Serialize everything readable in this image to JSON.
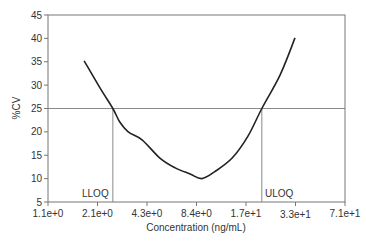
{
  "chart_data": {
    "type": "line",
    "title": "",
    "xlabel": "Concentration (ng/mL)",
    "ylabel": "%CV",
    "x_scale": "log2 (tick index positions)",
    "x_tick_labels": [
      "1.1e+0",
      "2.1e+0",
      "4.3e+0",
      "8.4e+0",
      "1.7e+1",
      "3.3e+1",
      "7.1e+1"
    ],
    "y_ticks": [
      5,
      10,
      15,
      20,
      25,
      30,
      35,
      40,
      45
    ],
    "ylim": [
      5,
      45
    ],
    "grid": false,
    "legend": null,
    "series": [
      {
        "name": "%CV profile",
        "x_index": [
          0.73,
          1.05,
          1.31,
          1.45,
          1.62,
          1.9,
          2.26,
          2.57,
          2.87,
          3.11,
          3.37,
          3.72,
          4.04,
          4.32,
          4.69,
          4.99
        ],
        "values": [
          35.2,
          29.4,
          25.0,
          22.1,
          20.0,
          18.3,
          14.4,
          12.3,
          11.0,
          10.0,
          11.5,
          14.4,
          19.1,
          25.0,
          32.2,
          40.1
        ]
      }
    ],
    "reference_lines": {
      "horizontal": {
        "y": 25,
        "label": ""
      },
      "vertical": [
        {
          "x_index": 1.31,
          "label": "LLOQ"
        },
        {
          "x_index": 4.32,
          "label": "ULOQ"
        }
      ]
    },
    "annotations": [
      "LLOQ",
      "ULOQ"
    ]
  },
  "labels": {
    "ylabel": "%CV",
    "xlabel": "Concentration (ng/mL)",
    "lloq": "LLOQ",
    "uloq": "ULOQ"
  },
  "colors": {
    "axis": "#777777",
    "curve": "#222222",
    "reference": "#8a8a8a",
    "text": "#333333"
  }
}
